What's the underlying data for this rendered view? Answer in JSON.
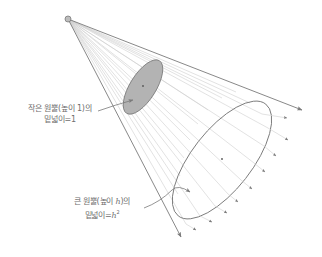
{
  "diagram": {
    "type": "cone-projection",
    "colors": {
      "line": "#7a7a7a",
      "ray": "#c8c8c8",
      "small_fill": "#b3b3b3",
      "text": "#6e6e6e"
    },
    "apex": {
      "x": 68,
      "y": 19
    },
    "small_cone": {
      "label_line1": "작은 원뿔(높이 1)의",
      "label_line2": "밑넓이=1"
    },
    "large_cone": {
      "label_line1": "큰 원뿔(높이 ",
      "label_var": "h",
      "label_line1_end": ")의",
      "label_line2": "밑넓이=",
      "label_var2": "h",
      "label_exp": "2"
    }
  }
}
